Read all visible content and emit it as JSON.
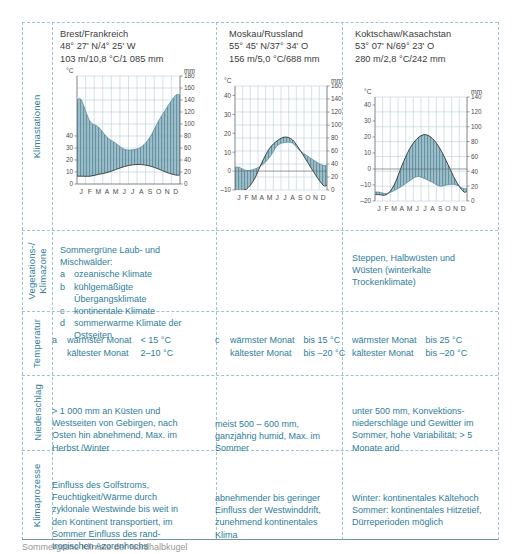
{
  "sheet": {
    "caption": "Sommergrüne Klimate der Nordhalbkugel"
  },
  "row_labels": {
    "climate_stations": "Klimastationen",
    "vegetation_zones": "Vegetations-/\nKlimazone",
    "temperature": "Temperatur",
    "precipitation": "Niederschlag",
    "climate_processes": "Klimaprozesse"
  },
  "stations": [
    {
      "name": "Brest/Frankreich",
      "coords": "48° 27' N/4° 25' W",
      "stats": "103 m/10,8 °C/1 085 mm"
    },
    {
      "name": "Moskau/Russland",
      "coords": "55° 45' N/37° 34' O",
      "stats": "156 m/5,0 °C/688 mm"
    },
    {
      "name": "Koktschaw/Kasachstan",
      "coords": "53° 07' N/69° 23' O",
      "stats": "280 m/2,8 °C/242 mm"
    }
  ],
  "vegetation": {
    "col1_title": "Sommergrüne Laub- und Mischwälder:",
    "col1_items": [
      {
        "letter": "a",
        "text": "ozeanische Klimate"
      },
      {
        "letter": "b",
        "text": "kühlgemäßigte Übergangsklimate"
      },
      {
        "letter": "c",
        "text": "kontinentale Klimate"
      },
      {
        "letter": "d",
        "text": "sommerwarme Klimate der Ostseiten"
      }
    ],
    "col3_text": "Steppen, Halbwüsten und Wüsten (winterkalte Trockenklimate)"
  },
  "temperature": {
    "col1": {
      "letter": "a",
      "rows": [
        {
          "key": "wärmster Monat",
          "val": "< 15 °C"
        },
        {
          "key": "kältester Monat",
          "val": "2–10 °C"
        }
      ]
    },
    "col2": {
      "letter": "c",
      "rows": [
        {
          "key": "wärmster Monat",
          "val": "bis 15 °C"
        },
        {
          "key": "kältester Monat",
          "val": "bis –20 °C"
        }
      ]
    },
    "col3": {
      "letter": "",
      "rows": [
        {
          "key": "wärmster Monat",
          "val": "bis 25 °C"
        },
        {
          "key": "kältester Monat",
          "val": "bis –20 °C"
        }
      ]
    }
  },
  "precipitation": {
    "col1": "> 1 000 mm an Küsten und Westseiten von Gebirgen, nach Osten hin abnehmend, Max. im Herbst /Winter",
    "col2": "meist 500 – 600 mm, ganzjährig humid, Max. im Sommer",
    "col3": "unter 500 mm, Konvektions-niederschläge und Gewitter im Sommer, hohe Variabilität; > 5 Monate arid"
  },
  "processes": {
    "col1": "Einfluss des Golfstroms, Feuchtigkeit/Wärme durch zyklonale Westwinde bis weit in den Kontinent transportiert, im Sommer Einfluss des rand-tropischen Azorenhochs",
    "col2": "abnehmender bis geringer Einfluss der Westwinddrift, zunehmend kontinentales Klima",
    "col3": "Winter: kontinentales Kältehoch Sommer: kontinentales Hitzetief, Dürreperioden möglich"
  },
  "colors": {
    "accent_text": "#2e7d9a",
    "body_text": "#3c3c3b",
    "fill": "#7ea9b8",
    "hatch": "#4b7f91",
    "grid": "#b9cfd8",
    "axis": "#6e6e6e",
    "dashed_border": "#9ec2cf"
  },
  "chart_data": [
    {
      "type": "area",
      "title": "Brest/Frankreich",
      "categories": [
        "J",
        "F",
        "M",
        "A",
        "M",
        "J",
        "J",
        "A",
        "S",
        "O",
        "N",
        "D"
      ],
      "xlabel": "",
      "ylabel": "°C",
      "y2label": "mm",
      "ylim": [
        0,
        90
      ],
      "yticks": [
        0,
        10,
        20,
        30,
        40
      ],
      "y2lim": [
        0,
        180
      ],
      "y2ticks": [
        0,
        20,
        40,
        60,
        80,
        100,
        120,
        140,
        160,
        180
      ],
      "grid": true,
      "series": [
        {
          "name": "Temperatur (°C)",
          "unit": "°C",
          "values": [
            6.5,
            6.5,
            8.0,
            9.5,
            12.0,
            14.5,
            16.0,
            16.2,
            15.0,
            12.5,
            9.5,
            7.5
          ]
        },
        {
          "name": "Niederschlag (mm)",
          "unit": "mm",
          "values": [
            140,
            105,
            95,
            78,
            68,
            58,
            57,
            62,
            78,
            105,
            128,
            148
          ]
        }
      ]
    },
    {
      "type": "area",
      "title": "Moskau/Russland",
      "categories": [
        "J",
        "F",
        "M",
        "A",
        "M",
        "J",
        "J",
        "A",
        "S",
        "O",
        "N",
        "D"
      ],
      "xlabel": "",
      "ylabel": "°C",
      "y2label": "mm",
      "ylim": [
        -10,
        45
      ],
      "yticks": [
        -10,
        0,
        10,
        20,
        30,
        40
      ],
      "y2lim": [
        0,
        160
      ],
      "y2ticks": [
        0,
        20,
        40,
        60,
        80,
        100,
        120,
        140,
        160
      ],
      "grid": true,
      "series": [
        {
          "name": "Temperatur (°C)",
          "unit": "°C",
          "values": [
            -10.3,
            -9.5,
            -4.5,
            4.5,
            12.0,
            16.0,
            18.0,
            16.5,
            11.0,
            4.5,
            -2.0,
            -7.5
          ]
        },
        {
          "name": "Niederschlag (mm)",
          "unit": "mm",
          "values": [
            35,
            30,
            32,
            38,
            50,
            68,
            73,
            72,
            60,
            52,
            44,
            38
          ]
        }
      ]
    },
    {
      "type": "area",
      "title": "Koktschaw/Kasachstan",
      "categories": [
        "J",
        "F",
        "M",
        "A",
        "M",
        "J",
        "J",
        "A",
        "S",
        "O",
        "N",
        "D"
      ],
      "xlabel": "",
      "ylabel": "°C",
      "y2label": "mm",
      "ylim": [
        -20,
        45
      ],
      "yticks": [
        -20,
        -10,
        0,
        10,
        20,
        30,
        40
      ],
      "y2lim": [
        0,
        140
      ],
      "y2ticks": [
        0,
        20,
        40,
        60,
        80,
        100,
        120,
        140
      ],
      "grid": true,
      "series": [
        {
          "name": "Temperatur (°C)",
          "unit": "°C",
          "values": [
            -16.0,
            -16.0,
            -10.0,
            2.0,
            12.5,
            19.0,
            21.5,
            19.0,
            12.5,
            3.0,
            -7.0,
            -14.0
          ]
        },
        {
          "name": "Niederschlag (mm)",
          "unit": "mm",
          "values": [
            12,
            10,
            14,
            20,
            27,
            33,
            30,
            25,
            20,
            22,
            22,
            17
          ]
        }
      ]
    }
  ]
}
